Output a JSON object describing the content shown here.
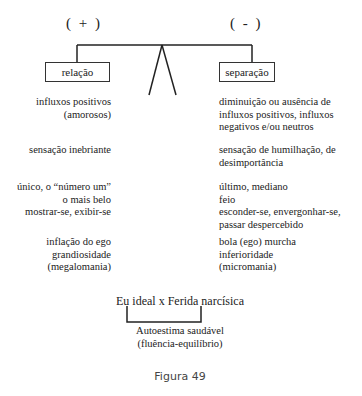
{
  "diagram": {
    "left_sign": "( + )",
    "right_sign": "( - )",
    "left_box": "relação",
    "right_box": "separação",
    "left_items": [
      [
        "influxos positivos",
        "(amorosos)"
      ],
      [
        "sensação inebriante"
      ],
      [
        "único, o “número um”",
        "o mais belo",
        "mostrar-se, exibir-se"
      ],
      [
        "inflação do ego",
        "grandiosidade",
        "(megalomania)"
      ]
    ],
    "right_items": [
      [
        "diminuição ou ausência de",
        "influxos positivos, influxos",
        "negativos e/ou neutros"
      ],
      [
        "sensação de humilhação, de",
        "desimportância"
      ],
      [
        "último, mediano",
        "feio",
        "esconder-se, envergonhar-se,",
        "passar despercebido"
      ],
      [
        "bola (ego) murcha",
        "inferioridade",
        "(micromania)"
      ]
    ],
    "bottom_title": "Eu ideal x Ferida narcísica",
    "bottom_result_line1": "Autoestima saudável",
    "bottom_result_line2": "(fluência-equilíbrio)",
    "caption": "Figura 49"
  }
}
